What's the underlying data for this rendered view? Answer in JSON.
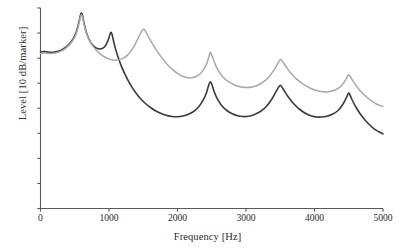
{
  "chart_data": {
    "type": "line",
    "title": "",
    "xlabel": "Frequency [Hz]",
    "ylabel": "Level [10 dB/marker]",
    "xlim": [
      0,
      5000
    ],
    "ylim": [
      0,
      80
    ],
    "xticks": [
      0,
      1000,
      2000,
      3000,
      4000,
      5000
    ],
    "xticklabels": [
      "0",
      "1000",
      "2000",
      "3000",
      "4000",
      "5000"
    ],
    "yticks": [
      0,
      10,
      20,
      30,
      40,
      50,
      60,
      70,
      80
    ],
    "yticklabels": [
      "",
      "",
      "",
      "",
      "",
      "",
      "",
      "",
      ""
    ],
    "grid": false,
    "legend": "none",
    "y_axis_note": "tick marks only, unlabeled; each marker = 10 dB",
    "series": [
      {
        "name": "dark-curve",
        "color": "#3a3a3a",
        "linewidth": 1.6,
        "peaks_hz": [
          600,
          1030,
          2480,
          3500,
          4500
        ],
        "x": [
          0,
          60,
          120,
          180,
          240,
          300,
          360,
          420,
          480,
          520,
          560,
          585,
          600,
          615,
          640,
          680,
          730,
          790,
          850,
          900,
          940,
          975,
          1000,
          1015,
          1030,
          1045,
          1060,
          1090,
          1130,
          1180,
          1250,
          1330,
          1420,
          1520,
          1620,
          1720,
          1820,
          1920,
          2000,
          2080,
          2160,
          2240,
          2310,
          2370,
          2420,
          2455,
          2480,
          2505,
          2540,
          2590,
          2650,
          2720,
          2800,
          2880,
          2950,
          3010,
          3070,
          3140,
          3220,
          3300,
          3380,
          3440,
          3480,
          3500,
          3520,
          3560,
          3620,
          3700,
          3790,
          3880,
          3960,
          4030,
          4100,
          4180,
          4260,
          4340,
          4410,
          4460,
          4490,
          4500,
          4515,
          4550,
          4610,
          4690,
          4780,
          4870,
          4940,
          5000
        ],
        "y": [
          62.5,
          62.6,
          62.4,
          62.3,
          62.6,
          63.2,
          64.2,
          65.6,
          67.9,
          70.2,
          74.3,
          77.3,
          78.0,
          76.9,
          73.4,
          69.4,
          66.4,
          64.5,
          63.7,
          63.8,
          64.6,
          66.4,
          68.2,
          69.6,
          70.3,
          69.4,
          67.6,
          64.2,
          60.6,
          56.8,
          52.6,
          48.6,
          45.1,
          42.2,
          40.0,
          38.4,
          37.3,
          36.7,
          36.6,
          36.9,
          37.6,
          38.8,
          40.6,
          43.0,
          46.0,
          49.2,
          50.6,
          49.2,
          46.3,
          43.3,
          40.9,
          39.1,
          37.8,
          37.0,
          36.7,
          36.7,
          37.0,
          37.7,
          38.9,
          40.8,
          43.8,
          46.7,
          48.6,
          49.2,
          48.6,
          46.9,
          44.4,
          41.7,
          39.4,
          37.8,
          36.9,
          36.5,
          36.5,
          36.8,
          37.6,
          39.0,
          41.4,
          43.9,
          45.7,
          46.1,
          45.5,
          43.3,
          40.2,
          36.9,
          34.0,
          31.8,
          30.6,
          29.8
        ]
      },
      {
        "name": "light-gray-curve",
        "color": "#a8a8a8",
        "linewidth": 1.5,
        "peaks_hz": [
          600,
          1500,
          2480,
          3500,
          4500
        ],
        "x": [
          0,
          60,
          120,
          180,
          240,
          300,
          360,
          420,
          480,
          520,
          560,
          585,
          600,
          615,
          640,
          680,
          730,
          790,
          850,
          910,
          970,
          1030,
          1090,
          1150,
          1210,
          1270,
          1330,
          1380,
          1430,
          1470,
          1495,
          1510,
          1530,
          1570,
          1620,
          1690,
          1770,
          1860,
          1950,
          2040,
          2130,
          2210,
          2290,
          2360,
          2420,
          2460,
          2480,
          2505,
          2545,
          2600,
          2670,
          2750,
          2840,
          2930,
          3010,
          3090,
          3170,
          3250,
          3330,
          3410,
          3470,
          3500,
          3530,
          3580,
          3650,
          3740,
          3840,
          3940,
          4030,
          4120,
          4210,
          4300,
          4390,
          4450,
          4485,
          4500,
          4520,
          4560,
          4630,
          4720,
          4820,
          4910,
          5000
        ],
        "y": [
          61.8,
          62.0,
          61.9,
          61.9,
          62.2,
          62.8,
          63.8,
          65.2,
          67.4,
          69.6,
          73.6,
          76.6,
          77.3,
          76.3,
          73.0,
          69.2,
          66.3,
          63.9,
          62.2,
          60.9,
          60.0,
          59.4,
          59.2,
          59.4,
          60.0,
          61.2,
          63.2,
          65.4,
          68.2,
          70.4,
          71.3,
          71.5,
          70.9,
          68.9,
          66.4,
          63.3,
          60.2,
          57.2,
          54.9,
          53.2,
          52.3,
          52.2,
          52.9,
          54.6,
          57.4,
          60.7,
          62.3,
          60.9,
          57.9,
          54.8,
          52.3,
          50.5,
          49.2,
          48.5,
          48.3,
          48.5,
          49.2,
          50.4,
          52.4,
          55.3,
          58.2,
          59.4,
          58.8,
          56.8,
          54.2,
          51.6,
          49.5,
          48.0,
          47.1,
          46.6,
          46.6,
          47.3,
          48.9,
          51.1,
          52.9,
          53.4,
          52.8,
          50.9,
          48.2,
          45.5,
          43.2,
          41.6,
          40.7
        ]
      }
    ]
  },
  "axes": {
    "x_axis_name": "frequency-axis",
    "y_axis_name": "level-axis"
  }
}
